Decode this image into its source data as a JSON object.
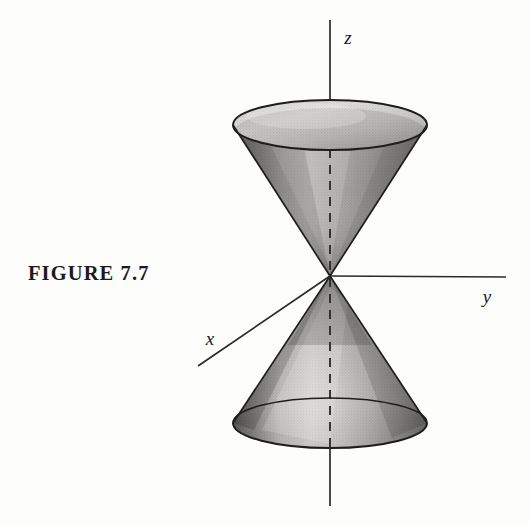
{
  "figure": {
    "caption": "FIGURE 7.7",
    "background_color": "#fdfdfc",
    "ink_color": "#1b1b1b"
  },
  "axes": {
    "z": {
      "label": "z",
      "label_x": 348,
      "label_y": 44,
      "orientation": "vertical-up"
    },
    "y": {
      "label": "y",
      "label_x": 487,
      "label_y": 303,
      "orientation": "right"
    },
    "x": {
      "label": "x",
      "label_y": 345,
      "label_x": 210,
      "orientation": "down-left-toward-viewer"
    },
    "z_axis_top_y": 20,
    "z_axis_bottom_y": 506,
    "y_axis_end_x": 506,
    "x_axis_end_x": 198,
    "x_axis_end_y": 366,
    "dashed_inside_solid_outside": "true"
  },
  "geometry": {
    "apex_x": 330,
    "apex_y": 276,
    "upper_ellipse": {
      "cx": 330,
      "cy": 125,
      "rx": 97,
      "ry": 25
    },
    "lower_ellipse": {
      "cx": 330,
      "cy": 423,
      "rx": 97,
      "ry": 25
    },
    "shading": "halftone-grayscale"
  },
  "colors": {
    "outline": "#1d1d1d",
    "cone_light": "#e3e2e0",
    "cone_mid": "#b9b8b6",
    "cone_dark": "#6f6e6c",
    "cone_darkest": "#4b4a49",
    "top_face_light": "#d9d8d5",
    "top_face_dark": "#a9a8a5",
    "axis_line": "#2a2a2a"
  }
}
